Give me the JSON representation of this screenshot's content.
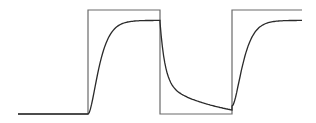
{
  "chart_data": {
    "type": "line",
    "title": "",
    "xlabel": "",
    "ylabel": "",
    "grid": false,
    "legend": "none",
    "xlim": [
      0,
      284
    ],
    "ylim": [
      0,
      1
    ],
    "series": [
      {
        "name": "square-wave input",
        "kind": "step",
        "points": [
          [
            0,
            0
          ],
          [
            70,
            0
          ],
          [
            70,
            1
          ],
          [
            142,
            1
          ],
          [
            142,
            0
          ],
          [
            214,
            0
          ],
          [
            214,
            1
          ],
          [
            284,
            1
          ]
        ]
      },
      {
        "name": "system response",
        "kind": "first-order",
        "segments": [
          {
            "t_start": 0,
            "t_end": 70,
            "start": 0.0,
            "target": 0.0,
            "tau": 1
          },
          {
            "t_start": 70,
            "t_end": 142,
            "start": 0.0,
            "target": 0.9,
            "tau": 12,
            "delay_shape": "s-curve"
          },
          {
            "t_start": 142,
            "t_end": 214,
            "start": 0.885,
            "target": 0.0,
            "tau": 14,
            "slow_tail": true
          },
          {
            "t_start": 214,
            "t_end": 284,
            "start": 0.077,
            "target": 0.9,
            "tau": 12,
            "delay_shape": "s-curve"
          }
        ],
        "key_values": {
          "plateau_first_pulse": 0.885,
          "trough_end": 0.077,
          "plateau_second_pulse": 0.885
        }
      }
    ]
  }
}
